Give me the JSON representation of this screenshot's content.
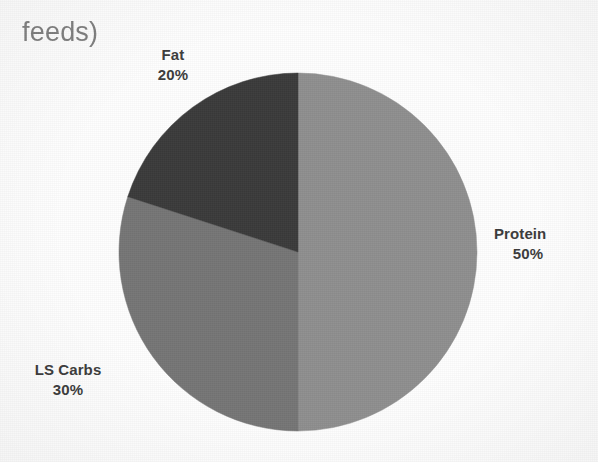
{
  "document": {
    "title_line1": "(shown as % of",
    "title_line1_truncated": true,
    "title_line2": "feeds)"
  },
  "chart_data": {
    "type": "pie",
    "title": "feeds)",
    "categories": [
      "Protein",
      "LS Carbs",
      "Fat"
    ],
    "values": [
      50,
      30,
      20
    ],
    "unit": "%",
    "labels": [
      "50%",
      "30%",
      "20%"
    ],
    "colors": [
      "#8e8e8e",
      "#757575",
      "#3a3a3a"
    ],
    "start_angle_deg": 0,
    "direction": "clockwise",
    "legend": "none",
    "grid": false,
    "slices": [
      {
        "name": "Protein",
        "value": 50,
        "label": "Protein",
        "pct_label": "50%",
        "color": "#8e8e8e",
        "start_deg": 0,
        "end_deg": 180
      },
      {
        "name": "LS Carbs",
        "value": 30,
        "label": "LS Carbs",
        "pct_label": "30%",
        "color": "#757575",
        "start_deg": 180,
        "end_deg": 288
      },
      {
        "name": "Fat",
        "value": 20,
        "label": "Fat",
        "pct_label": "20%",
        "color": "#3a3a3a",
        "start_deg": 288,
        "end_deg": 360
      }
    ]
  },
  "labels": {
    "fat": {
      "name": "Fat",
      "pct": "20%"
    },
    "protein": {
      "name": "Protein",
      "pct": "50%"
    },
    "ls_carbs": {
      "name": "LS Carbs",
      "pct": "30%"
    }
  },
  "colors": {
    "protein_slice": "#8e8e8e",
    "carbs_slice": "#757575",
    "fat_slice": "#3a3a3a",
    "label_text": "#3b3b3b",
    "title_text": "#6a6a6a",
    "page_background": "#fdfdfd"
  }
}
